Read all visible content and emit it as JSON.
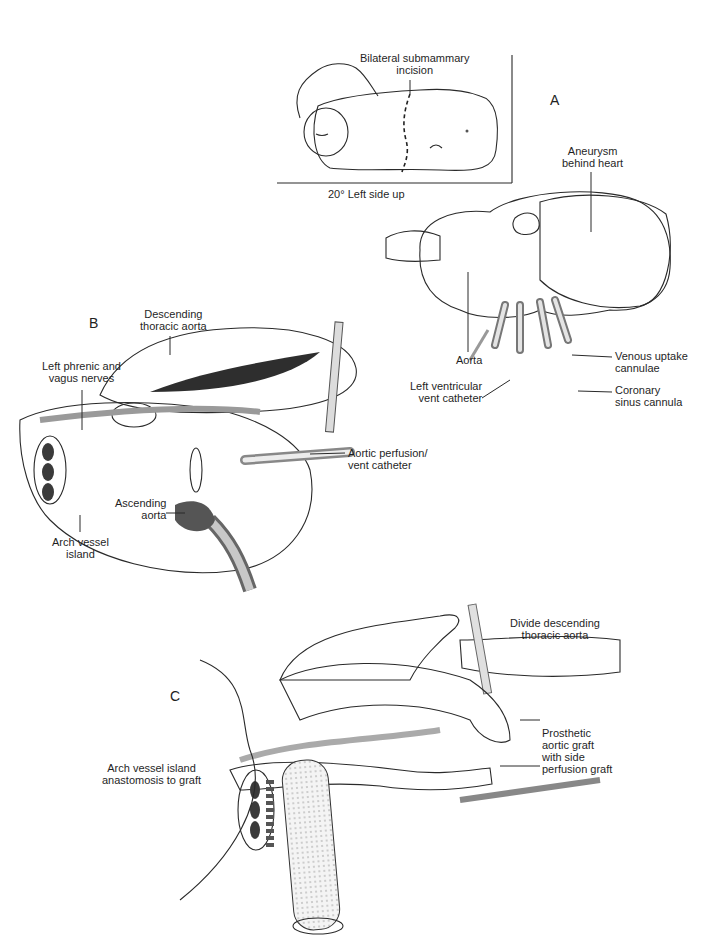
{
  "figure": {
    "panels": [
      {
        "id": "A",
        "letter": "A",
        "inset": {
          "caption": "20° Left side up",
          "labels": {
            "incision": "Bilateral submammary\nincision"
          }
        },
        "labels": {
          "aneurysm": "Aneurysm\nbehind heart",
          "aorta": "Aorta",
          "venous": "Venous uptake\ncannulae",
          "lv_vent": "Left ventricular\nvent catheter",
          "coronary": "Coronary\nsinus cannula"
        }
      },
      {
        "id": "B",
        "letter": "B",
        "labels": {
          "descending": "Descending\nthoracic aorta",
          "phrenic": "Left phrenic and\nvagus nerves",
          "aortic_perfusion": "Aortic perfusion/\nvent catheter",
          "ascending": "Ascending\naorta",
          "arch_island": "Arch vessel\nisland"
        }
      },
      {
        "id": "C",
        "letter": "C",
        "labels": {
          "divide": "Divide descending\nthoracic aorta",
          "prosthetic": "Prosthetic\naortic graft\nwith side\nperfusion graft",
          "arch_anastomosis": "Arch vessel island\nanastomosis to graft"
        }
      }
    ],
    "colors": {
      "ink": "#2a2a2a",
      "shade_dark": "#6e6e6e",
      "shade_mid": "#a8a8a8",
      "shade_light": "#dcdcdc",
      "background": "#ffffff"
    }
  }
}
